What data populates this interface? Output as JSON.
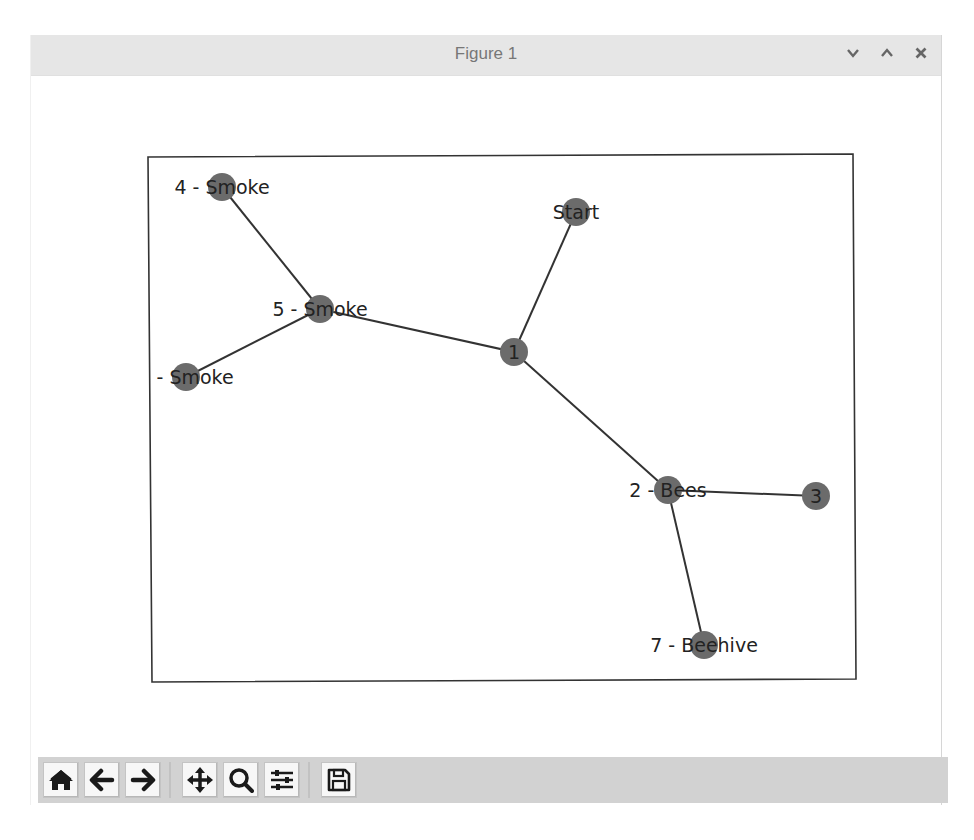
{
  "window": {
    "title": "Figure 1",
    "controls": [
      {
        "name": "minimize",
        "icon": "chevron-down-icon"
      },
      {
        "name": "maximize",
        "icon": "chevron-up-icon"
      },
      {
        "name": "close",
        "icon": "close-icon"
      }
    ]
  },
  "toolbar": {
    "buttons": [
      {
        "name": "home",
        "icon": "home-icon",
        "tooltip": "Reset original view"
      },
      {
        "name": "back",
        "icon": "arrow-left-icon",
        "tooltip": "Back to previous view"
      },
      {
        "name": "forward",
        "icon": "arrow-right-icon",
        "tooltip": "Forward to next view"
      },
      {
        "name": "pan",
        "icon": "move-icon",
        "tooltip": "Pan axes"
      },
      {
        "name": "zoom",
        "icon": "magnifier-icon",
        "tooltip": "Zoom to rectangle"
      },
      {
        "name": "configure",
        "icon": "sliders-icon",
        "tooltip": "Configure subplots"
      },
      {
        "name": "save",
        "icon": "floppy-disk-icon",
        "tooltip": "Save the figure"
      }
    ]
  },
  "graph": {
    "node_color": "#6b6b6b",
    "edge_color": "#333333",
    "label_color": "#222222",
    "nodes": [
      {
        "id": "start",
        "label": "Start",
        "x": 576,
        "y": 212
      },
      {
        "id": "n1",
        "label": "1",
        "x": 514,
        "y": 352
      },
      {
        "id": "n2",
        "label": "2 - Bees",
        "x": 668,
        "y": 490
      },
      {
        "id": "n3",
        "label": "3",
        "x": 816,
        "y": 496
      },
      {
        "id": "n4",
        "label": "4 - Smoke",
        "x": 222,
        "y": 187
      },
      {
        "id": "n5",
        "label": "5 - Smoke",
        "x": 320,
        "y": 309
      },
      {
        "id": "n6",
        "label": "6 - Smoke",
        "x": 186,
        "y": 377
      },
      {
        "id": "n7",
        "label": "7 - Beehive",
        "x": 704,
        "y": 645
      }
    ],
    "edges": [
      [
        "start",
        "n1"
      ],
      [
        "n1",
        "n5"
      ],
      [
        "n1",
        "n2"
      ],
      [
        "n5",
        "n4"
      ],
      [
        "n5",
        "n6"
      ],
      [
        "n2",
        "n3"
      ],
      [
        "n2",
        "n7"
      ]
    ]
  }
}
